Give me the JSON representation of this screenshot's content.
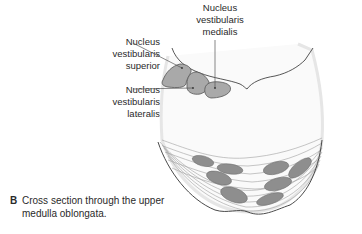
{
  "figure": {
    "panel_letter": "B",
    "caption_line1": "Cross section through the upper",
    "caption_line2": "medulla oblongata."
  },
  "labels": {
    "superior": {
      "line1": "Nucleus",
      "line2": "vestibularis",
      "line3": "superior"
    },
    "lateralis": {
      "line1": "Nucleus",
      "line2": "vestibularis",
      "line3": "lateralis"
    },
    "medialis": {
      "line1": "Nucleus",
      "line2": "vestibularis",
      "line3": "medialis"
    }
  },
  "colors": {
    "nucleus_fill": "#a9a9a9",
    "nucleus_stroke": "#555555",
    "outline": "#555555",
    "fiber_lines": "#9a9a9a",
    "text": "#2a2a2a"
  }
}
